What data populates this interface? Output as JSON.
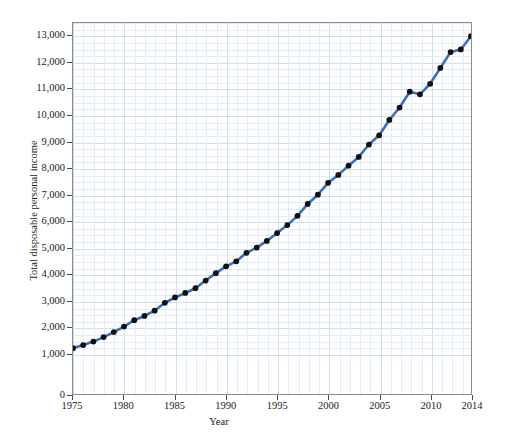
{
  "chart_data": {
    "type": "line",
    "title": "",
    "xlabel": "Year",
    "ylabel": "Total disposable personal income",
    "xlim": [
      1975,
      2014
    ],
    "ylim": [
      0,
      13500
    ],
    "grid": true,
    "legend": false,
    "x_tick_labels": [
      "1975",
      "1980",
      "1985",
      "1990",
      "1995",
      "2000",
      "2005",
      "2010",
      "2014"
    ],
    "x_ticks": [
      1975,
      1980,
      1985,
      1990,
      1995,
      2000,
      2005,
      2010,
      2014
    ],
    "y_tick_labels": [
      "0",
      "1,000",
      "2,000",
      "3,000",
      "4,000",
      "5,000",
      "6,000",
      "7,000",
      "8,000",
      "9,000",
      "10,000",
      "11,000",
      "12,000",
      "13,000"
    ],
    "y_ticks": [
      0,
      1000,
      2000,
      3000,
      4000,
      5000,
      6000,
      7000,
      8000,
      9000,
      10000,
      11000,
      12000,
      13000
    ],
    "x": [
      1975,
      1976,
      1977,
      1978,
      1979,
      1980,
      1981,
      1982,
      1983,
      1984,
      1985,
      1986,
      1987,
      1988,
      1989,
      1990,
      1991,
      1992,
      1993,
      1994,
      1995,
      1996,
      1997,
      1998,
      1999,
      2000,
      2001,
      2002,
      2003,
      2004,
      2005,
      2006,
      2007,
      2008,
      2009,
      2010,
      2011,
      2012,
      2013,
      2014
    ],
    "values": [
      1190,
      1310,
      1440,
      1610,
      1800,
      2010,
      2250,
      2410,
      2610,
      2910,
      3110,
      3280,
      3460,
      3750,
      4030,
      4290,
      4480,
      4800,
      5000,
      5250,
      5550,
      5850,
      6200,
      6650,
      7000,
      7450,
      7750,
      8100,
      8430,
      8900,
      9250,
      9830,
      10300,
      10900,
      10800,
      11200,
      11800,
      12400,
      12500,
      13000
    ],
    "marker": "circle",
    "marker_color": "#111111",
    "line_color": "#3a6fb8",
    "grid_color": "#cfdcf4",
    "grid_minor_color": "#e4ecfa",
    "minor_x_step": 1,
    "minor_y_step": 250
  }
}
